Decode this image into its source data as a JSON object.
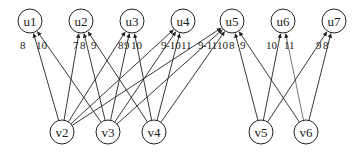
{
  "diagram": {
    "type": "bipartite-graph",
    "top_nodes": [
      {
        "id": "u1",
        "label": "u1",
        "x": 30,
        "y": 21
      },
      {
        "id": "u2",
        "label": "u2",
        "x": 81,
        "y": 21
      },
      {
        "id": "u3",
        "label": "u3",
        "x": 132,
        "y": 21
      },
      {
        "id": "u4",
        "label": "u4",
        "x": 183,
        "y": 21
      },
      {
        "id": "u5",
        "label": "u5",
        "x": 232,
        "y": 21
      },
      {
        "id": "u6",
        "label": "u6",
        "x": 283,
        "y": 21
      },
      {
        "id": "u7",
        "label": "u7",
        "x": 334,
        "y": 21
      }
    ],
    "bottom_nodes": [
      {
        "id": "v2",
        "label": "v2",
        "x": 62,
        "y": 132
      },
      {
        "id": "v3",
        "label": "v3",
        "x": 108,
        "y": 132
      },
      {
        "id": "v4",
        "label": "v4",
        "x": 154,
        "y": 132
      },
      {
        "id": "v5",
        "label": "v5",
        "x": 261,
        "y": 132
      },
      {
        "id": "v6",
        "label": "v6",
        "x": 306,
        "y": 132
      }
    ],
    "edges": [
      {
        "from": "v2",
        "to": "u1",
        "weight": "8"
      },
      {
        "from": "v3",
        "to": "u1",
        "weight": "10"
      },
      {
        "from": "v2",
        "to": "u2",
        "weight": "7"
      },
      {
        "from": "v3",
        "to": "u2",
        "weight": "8"
      },
      {
        "from": "v4",
        "to": "u2",
        "weight": "9"
      },
      {
        "from": "v2",
        "to": "u3",
        "weight": "8"
      },
      {
        "from": "v3",
        "to": "u3",
        "weight": "9"
      },
      {
        "from": "v4",
        "to": "u3",
        "weight": "10"
      },
      {
        "from": "v2",
        "to": "u4",
        "weight": "9"
      },
      {
        "from": "v3",
        "to": "u4",
        "weight": "10"
      },
      {
        "from": "v4",
        "to": "u4",
        "weight": "11"
      },
      {
        "from": "v2",
        "to": "u5",
        "weight": "9"
      },
      {
        "from": "v3",
        "to": "u5",
        "weight": "11"
      },
      {
        "from": "v4",
        "to": "u5",
        "weight": "10"
      },
      {
        "from": "v5",
        "to": "u5",
        "weight": "8"
      },
      {
        "from": "v6",
        "to": "u5",
        "weight": "9"
      },
      {
        "from": "v5",
        "to": "u6",
        "weight": "10"
      },
      {
        "from": "v6",
        "to": "u6",
        "weight": "11"
      },
      {
        "from": "v5",
        "to": "u7",
        "weight": "9"
      },
      {
        "from": "v6",
        "to": "u7",
        "weight": "8"
      }
    ],
    "weight_labels": [
      {
        "text": "8",
        "x": 20,
        "y": 49
      },
      {
        "text": "10",
        "x": 36,
        "y": 49
      },
      {
        "text": "7",
        "x": 73,
        "y": 49
      },
      {
        "text": "8",
        "x": 80,
        "y": 49
      },
      {
        "text": "9",
        "x": 91,
        "y": 49
      },
      {
        "text": "8",
        "x": 118,
        "y": 49
      },
      {
        "text": "9",
        "x": 124,
        "y": 49
      },
      {
        "text": "10",
        "x": 131,
        "y": 49
      },
      {
        "text": "9",
        "x": 161,
        "y": 49
      },
      {
        "text": "-10",
        "x": 166,
        "y": 49
      },
      {
        "text": "11",
        "x": 181,
        "y": 49
      },
      {
        "text": "9",
        "x": 198,
        "y": 49
      },
      {
        "text": "-11",
        "x": 203,
        "y": 49
      },
      {
        "text": "10",
        "x": 217,
        "y": 49
      },
      {
        "text": "8",
        "x": 229,
        "y": 49
      },
      {
        "text": "9",
        "x": 240,
        "y": 49
      },
      {
        "text": "10",
        "x": 266,
        "y": 49
      },
      {
        "text": "11",
        "x": 284,
        "y": 49
      },
      {
        "text": "9",
        "x": 316,
        "y": 49
      },
      {
        "text": "8",
        "x": 323,
        "y": 49
      }
    ],
    "node_radius": 12
  }
}
